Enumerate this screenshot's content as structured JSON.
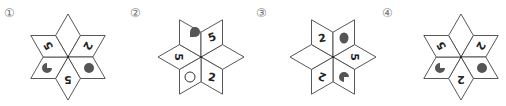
{
  "options": [
    {
      "label": "①",
      "orientation": "vertical",
      "petals": [
        {
          "position": "top",
          "content": "empty"
        },
        {
          "position": "upper-right",
          "content": "digit",
          "text": "2"
        },
        {
          "position": "lower-right",
          "content": "filled-circle"
        },
        {
          "position": "bottom",
          "content": "digit",
          "text": "5"
        },
        {
          "position": "lower-left",
          "content": "pacman"
        },
        {
          "position": "upper-left",
          "content": "digit",
          "text": "5"
        }
      ]
    },
    {
      "label": "②",
      "orientation": "horizontal",
      "petals": [
        {
          "position": "upper-left",
          "content": "pacman"
        },
        {
          "position": "upper-right",
          "content": "digit",
          "text": "5"
        },
        {
          "position": "right",
          "content": "empty"
        },
        {
          "position": "lower-right",
          "content": "digit",
          "text": "2"
        },
        {
          "position": "lower-left",
          "content": "hollow-circle"
        },
        {
          "position": "left",
          "content": "digit",
          "text": "5"
        }
      ]
    },
    {
      "label": "③",
      "orientation": "horizontal",
      "petals": [
        {
          "position": "upper-left",
          "content": "digit",
          "text": "2"
        },
        {
          "position": "upper-right",
          "content": "filled-circle"
        },
        {
          "position": "right",
          "content": "digit",
          "text": "5"
        },
        {
          "position": "lower-right",
          "content": "pacman"
        },
        {
          "position": "lower-left",
          "content": "digit",
          "text": "2"
        },
        {
          "position": "left",
          "content": "empty"
        }
      ]
    },
    {
      "label": "④",
      "orientation": "vertical",
      "petals": [
        {
          "position": "top",
          "content": "empty"
        },
        {
          "position": "upper-right",
          "content": "digit",
          "text": "2"
        },
        {
          "position": "lower-right",
          "content": "filled-circle"
        },
        {
          "position": "bottom",
          "content": "digit",
          "text": "2"
        },
        {
          "position": "lower-left",
          "content": "pacman"
        },
        {
          "position": "upper-left",
          "content": "digit",
          "text": "5"
        }
      ]
    }
  ],
  "colors": {
    "outline": "#444444",
    "shape_fill": "#555555",
    "label": "#777777"
  }
}
